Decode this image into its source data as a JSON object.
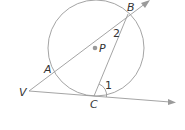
{
  "diagram": {
    "colors": {
      "line": "#9a9a9a",
      "text": "#333333",
      "point": "#999999"
    },
    "circle": {
      "center_label": "P",
      "cx": 96,
      "cy": 48,
      "r": 48
    },
    "points": {
      "A": "A",
      "B": "B",
      "C": "C",
      "P": "P",
      "V": "V"
    },
    "angles": {
      "angle1": "1",
      "angle2": "2"
    },
    "segments": [
      "VB (ray through A and B)",
      "VC (ray tangent at C)",
      "BC (chord)"
    ]
  }
}
